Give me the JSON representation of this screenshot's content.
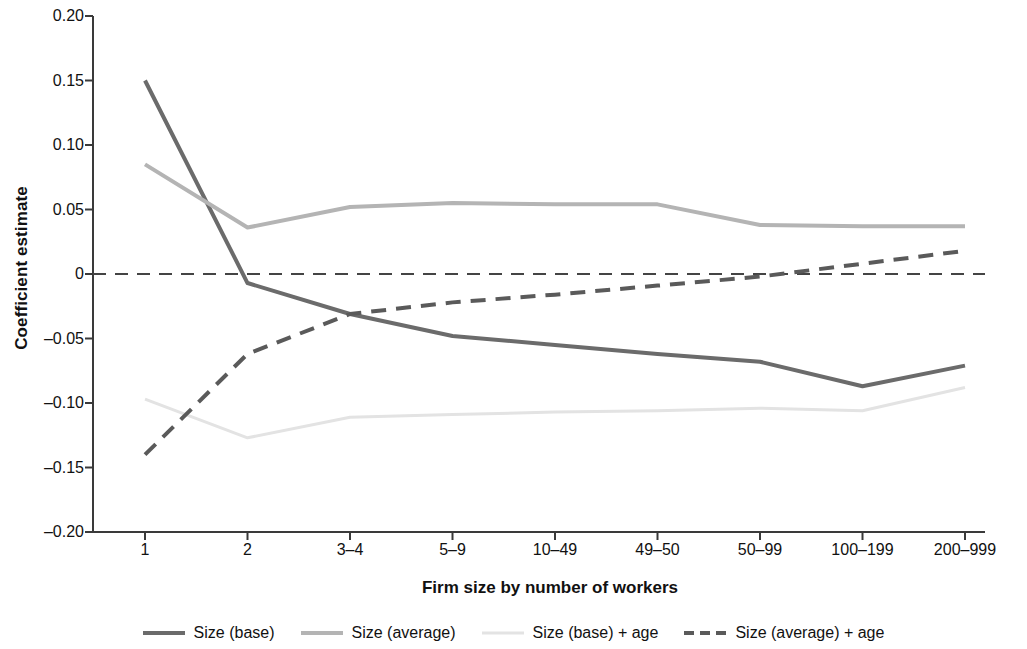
{
  "chart_data": {
    "type": "line",
    "title": "",
    "xlabel": "Firm size by number of workers",
    "ylabel": "Coefficient estimate",
    "categories": [
      "1",
      "2",
      "3–4",
      "5–9",
      "10–49",
      "49–50",
      "50–99",
      "100–199",
      "200–999"
    ],
    "ylim": [
      -0.2,
      0.2
    ],
    "yticks": [
      "0.20",
      "0.15",
      "0.10",
      "0.05",
      "0",
      "–0.05",
      "–0.10",
      "–0.15",
      "–0.20"
    ],
    "ytick_values": [
      0.2,
      0.15,
      0.1,
      0.05,
      0,
      -0.05,
      -0.1,
      -0.15,
      -0.2
    ],
    "grid": false,
    "legend_position": "bottom",
    "zero_reference_line": 0,
    "series": [
      {
        "name": "Size (base)",
        "values": [
          0.15,
          -0.007,
          -0.031,
          -0.048,
          -0.055,
          -0.062,
          -0.068,
          -0.087,
          -0.071
        ],
        "color": "#6b6b6b",
        "style": "solid",
        "width": 4
      },
      {
        "name": "Size (average)",
        "values": [
          0.085,
          0.036,
          0.052,
          0.055,
          0.054,
          0.054,
          0.038,
          0.037,
          0.037
        ],
        "color": "#b4b4b4",
        "style": "solid",
        "width": 4
      },
      {
        "name": "Size (base) + age",
        "values": [
          -0.097,
          -0.127,
          -0.111,
          -0.109,
          -0.107,
          -0.106,
          -0.104,
          -0.106,
          -0.088
        ],
        "color": "#e3e3e3",
        "style": "solid",
        "width": 3
      },
      {
        "name": "Size (average) + age",
        "values": [
          -0.14,
          -0.062,
          -0.031,
          -0.022,
          -0.016,
          -0.009,
          -0.002,
          0.008,
          0.018
        ],
        "color": "#5a5a5a",
        "style": "dashed",
        "width": 4
      }
    ],
    "zero_line": {
      "color": "#444444",
      "style": "dashed",
      "width": 2
    }
  },
  "legend": {
    "items": [
      {
        "label": "Size (base)"
      },
      {
        "label": "Size (average)"
      },
      {
        "label": "Size (base) + age"
      },
      {
        "label": "Size (average) + age"
      }
    ]
  },
  "axes": {
    "axis_color": "#3a3a3a"
  }
}
